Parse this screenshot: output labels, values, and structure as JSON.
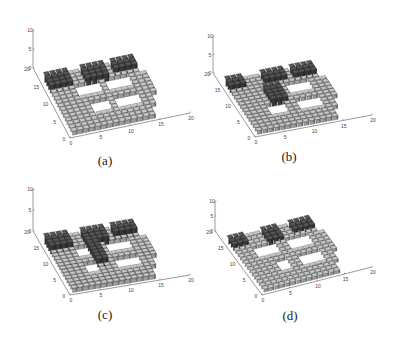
{
  "figure": {
    "panels": [
      {
        "id": "a",
        "caption": "(a)",
        "caption_pos": [
          105,
          162
        ]
      },
      {
        "id": "b",
        "caption": "(b)",
        "caption_pos": [
          289,
          158
        ]
      },
      {
        "id": "c",
        "caption": "(c)",
        "caption_pos": [
          105,
          316
        ]
      },
      {
        "id": "d",
        "caption": "(d)",
        "caption_pos": [
          290,
          317
        ]
      }
    ]
  },
  "chart_data": [
    {
      "type": "bar3d",
      "panel": "a",
      "title": "(a)",
      "xlabel": "",
      "ylabel": "",
      "zlabel": "",
      "xlim": [
        0,
        20
      ],
      "ylim": [
        0,
        20
      ],
      "zlim": [
        0,
        10
      ],
      "xticks": [
        0,
        5,
        10,
        15,
        20
      ],
      "yticks": [
        0,
        5,
        10,
        15,
        20
      ],
      "zticks": [
        0,
        5,
        10
      ],
      "projection": {
        "origin": [
          70,
          138
        ],
        "ex": [
          6.0,
          -1.25
        ],
        "ey": [
          -1.85,
          -3.5
        ],
        "ez": [
          0,
          -3.8
        ]
      },
      "towers": [
        [
          1,
          13,
          4,
          16
        ],
        [
          7,
          13,
          10,
          16
        ],
        [
          12,
          14,
          15,
          16
        ]
      ],
      "holes": [
        [
          5,
          10,
          8,
          12
        ],
        [
          10,
          10,
          13,
          12
        ],
        [
          6,
          5,
          8,
          7
        ],
        [
          10,
          5,
          13,
          7
        ]
      ],
      "base_height": 1,
      "tower_height": 2,
      "grid_size": 16
    },
    {
      "type": "bar3d",
      "panel": "b",
      "title": "(b)",
      "xlim": [
        0,
        20
      ],
      "ylim": [
        0,
        20
      ],
      "zlim": [
        0,
        10
      ],
      "xticks": [
        0,
        5,
        10,
        15,
        20
      ],
      "yticks": [
        0,
        5,
        10,
        15,
        20
      ],
      "zticks": [
        0,
        5,
        10
      ],
      "projection": {
        "origin": [
          255,
          137
        ],
        "ex": [
          5.85,
          -1.1
        ],
        "ey": [
          -2.1,
          -3.2
        ],
        "ez": [
          0,
          -3.7
        ]
      },
      "towers": [
        [
          1,
          14,
          3,
          16
        ],
        [
          7,
          14,
          10,
          16
        ],
        [
          12,
          14,
          15,
          16
        ],
        [
          6,
          8,
          8,
          12
        ]
      ],
      "holes": [
        [
          10,
          10,
          13,
          12
        ],
        [
          5,
          5,
          7,
          7
        ],
        [
          10,
          5,
          13,
          7
        ]
      ],
      "base_height": 1,
      "tower_height": 2,
      "grid_size": 16
    },
    {
      "type": "bar3d",
      "panel": "c",
      "title": "(c)",
      "xlim": [
        0,
        20
      ],
      "ylim": [
        0,
        20
      ],
      "zlim": [
        0,
        10
      ],
      "xticks": [
        0,
        5,
        10,
        15,
        20
      ],
      "yticks": [
        0,
        5,
        10,
        15,
        20
      ],
      "zticks": [
        0,
        5,
        10
      ],
      "projection": {
        "origin": [
          70,
          295
        ],
        "ex": [
          6.0,
          -1.0
        ],
        "ey": [
          -1.85,
          -3.2
        ],
        "ez": [
          0,
          -4.2
        ]
      },
      "towers": [
        [
          1,
          13,
          4,
          16
        ],
        [
          7,
          13,
          10,
          16
        ],
        [
          12,
          14,
          15,
          16
        ],
        [
          7,
          7,
          8,
          12
        ]
      ],
      "holes": [
        [
          5,
          10,
          6,
          12
        ],
        [
          10,
          10,
          13,
          12
        ],
        [
          5,
          5,
          6,
          7
        ],
        [
          10,
          5,
          13,
          7
        ]
      ],
      "base_height": 1,
      "tower_height": 2,
      "grid_size": 16
    },
    {
      "type": "bar3d",
      "panel": "d",
      "title": "(d)",
      "xlim": [
        0,
        20
      ],
      "ylim": [
        0,
        20
      ],
      "zlim": [
        0,
        10
      ],
      "xticks": [
        0,
        5,
        10,
        15,
        20
      ],
      "yticks": [
        0,
        5,
        10,
        15,
        20
      ],
      "zticks": [
        0,
        5,
        10
      ],
      "projection": {
        "origin": [
          262,
          295
        ],
        "ex": [
          5.5,
          -1.4
        ],
        "ey": [
          -2.35,
          -3.2
        ],
        "ez": [
          0,
          -3.0
        ]
      },
      "towers": [
        [
          1,
          14,
          3,
          16
        ],
        [
          7,
          13,
          9,
          16
        ],
        [
          12,
          14,
          15,
          16
        ]
      ],
      "holes": [
        [
          4,
          10,
          7,
          12
        ],
        [
          10,
          10,
          13,
          12
        ],
        [
          6,
          5,
          7,
          7
        ],
        [
          10,
          5,
          13,
          7
        ]
      ],
      "base_height": 1,
      "tower_height": 2,
      "grid_size": 16
    }
  ]
}
